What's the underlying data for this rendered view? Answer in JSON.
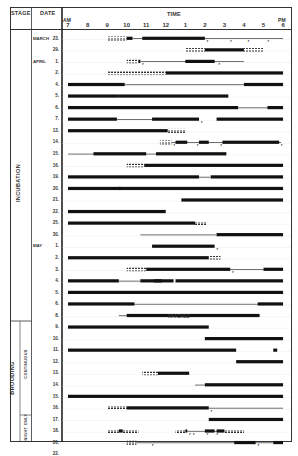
{
  "header": {
    "stage": "STAGE",
    "date": "DATE",
    "time": "TIME",
    "am": "AM",
    "pm": "PM",
    "hours": [
      "7",
      "8",
      "9",
      "10",
      "11",
      "12",
      "1",
      "2",
      "3",
      "4",
      "5",
      "6"
    ]
  },
  "stages": {
    "incubation": "INCUBATION",
    "brooding": "BROODING",
    "continuous": "CONTINUOUS",
    "night_only": "NIGHT ONLY"
  },
  "months": [
    {
      "label": "MARCH",
      "row": 0
    },
    {
      "label": "APRIL",
      "row": 2
    },
    {
      "label": "MAY",
      "row": 18
    }
  ],
  "annotation": {
    "label": "HATCHED",
    "row": 22
  },
  "chart_data": {
    "type": "gantt",
    "title": "",
    "xlabel": "TIME",
    "ylabel": "DATE",
    "x_ticks": [
      "7 AM",
      "8",
      "9",
      "10",
      "11",
      "12",
      "1",
      "2",
      "3",
      "4",
      "5",
      "6 PM"
    ],
    "xlim": [
      7,
      18
    ],
    "legend": {
      "solid_bar": "on nest / attendance",
      "thin_line": "present nearby",
      "dashed": "partial observation",
      "arrow": "departure"
    },
    "rows": [
      {
        "date": "23",
        "month": "MARCH",
        "stage": "incubation",
        "bars": [
          [
            10.0,
            10.3
          ],
          [
            10.8,
            14.0
          ]
        ],
        "thin": [
          [
            10.3,
            18.0
          ]
        ],
        "dashed": [
          [
            9.0,
            10.0
          ]
        ],
        "marks": [
          14.1,
          15.3,
          16.2,
          17.2
        ]
      },
      {
        "date": "29",
        "month": "MARCH",
        "stage": "incubation",
        "bars": [
          [
            14.0,
            16.0
          ]
        ],
        "thin": [],
        "dashed": [
          [
            13.0,
            14.0
          ],
          [
            16.0,
            17.0
          ]
        ],
        "marks": []
      },
      {
        "date": "1",
        "month": "APRIL",
        "stage": "incubation",
        "bars": [
          [
            10.6,
            10.7
          ],
          [
            13.0,
            14.5
          ]
        ],
        "thin": [
          [
            10.7,
            16.0
          ]
        ],
        "dashed": [
          [
            10.0,
            10.6
          ]
        ],
        "marks": [
          10.8,
          14.7
        ]
      },
      {
        "date": "2",
        "month": "APRIL",
        "stage": "incubation",
        "bars": [
          [
            12.0,
            18.0
          ]
        ],
        "thin": [],
        "dashed": [
          [
            9.0,
            12.0
          ]
        ],
        "marks": []
      },
      {
        "date": "4",
        "month": "APRIL",
        "stage": "incubation",
        "bars": [
          [
            7.0,
            9.9
          ],
          [
            16.0,
            18.0
          ]
        ],
        "thin": [
          [
            9.9,
            16.0
          ]
        ],
        "dashed": [],
        "marks": []
      },
      {
        "date": "5",
        "month": "APRIL",
        "stage": "incubation",
        "bars": [
          [
            7.0,
            9.6
          ],
          [
            9.6,
            15.2
          ]
        ],
        "thin": [],
        "dashed": [],
        "marks": []
      },
      {
        "date": "6",
        "month": "APRIL",
        "stage": "incubation",
        "bars": [
          [
            7.0,
            15.7
          ],
          [
            17.2,
            18.0
          ]
        ],
        "thin": [
          [
            15.7,
            17.2
          ]
        ],
        "dashed": [],
        "marks": []
      },
      {
        "date": "7",
        "month": "APRIL",
        "stage": "incubation",
        "bars": [
          [
            7.0,
            9.5
          ],
          [
            11.3,
            13.7
          ],
          [
            14.6,
            18.0
          ]
        ],
        "thin": [
          [
            9.5,
            11.3
          ]
        ],
        "dashed": [],
        "marks": [
          13.8
        ]
      },
      {
        "date": "13",
        "month": "APRIL",
        "stage": "incubation",
        "bars": [
          [
            7.0,
            12.1
          ]
        ],
        "thin": [],
        "dashed": [
          [
            12.1,
            13.0
          ]
        ],
        "marks": []
      },
      {
        "date": "14",
        "month": "APRIL",
        "stage": "incubation",
        "bars": [
          [
            12.5,
            13.1
          ],
          [
            13.7,
            14.2
          ],
          [
            14.9,
            17.8
          ]
        ],
        "thin": [
          [
            12.3,
            17.9
          ]
        ],
        "dashed": [
          [
            11.7,
            12.3
          ]
        ],
        "marks": [
          12.4,
          13.6,
          14.8,
          17.9
        ]
      },
      {
        "date": "15",
        "month": "APRIL",
        "stage": "incubation",
        "bars": [
          [
            8.3,
            11.0
          ],
          [
            11.5,
            15.1
          ]
        ],
        "thin": [
          [
            7.0,
            8.3
          ],
          [
            11.0,
            11.5
          ]
        ],
        "dashed": [],
        "marks": []
      },
      {
        "date": "16",
        "month": "APRIL",
        "stage": "incubation",
        "bars": [
          [
            10.9,
            18.0
          ]
        ],
        "thin": [],
        "dashed": [
          [
            10.0,
            10.9
          ]
        ],
        "marks": []
      },
      {
        "date": "19",
        "month": "APRIL",
        "stage": "incubation",
        "bars": [
          [
            7.0,
            13.7
          ],
          [
            14.3,
            18.0
          ]
        ],
        "thin": [
          [
            13.7,
            14.3
          ]
        ],
        "dashed": [],
        "marks": []
      },
      {
        "date": "20",
        "month": "APRIL",
        "stage": "incubation",
        "bars": [
          [
            7.0,
            9.7
          ],
          [
            9.6,
            18.0
          ]
        ],
        "thin": [],
        "dashed": [],
        "marks": []
      },
      {
        "date": "21",
        "month": "APRIL",
        "stage": "incubation",
        "bars": [
          [
            12.8,
            18.0
          ]
        ],
        "thin": [],
        "dashed": [],
        "marks": []
      },
      {
        "date": "22",
        "month": "APRIL",
        "stage": "incubation",
        "bars": [
          [
            7.0,
            12.0
          ]
        ],
        "thin": [],
        "dashed": [],
        "marks": []
      },
      {
        "date": "25",
        "month": "APRIL",
        "stage": "incubation",
        "bars": [
          [
            7.0,
            13.5
          ]
        ],
        "thin": [],
        "dashed": [
          [
            13.5,
            14.1
          ]
        ],
        "marks": []
      },
      {
        "date": "30",
        "month": "APRIL",
        "stage": "incubation",
        "bars": [
          [
            14.6,
            18.0
          ]
        ],
        "thin": [
          [
            10.7,
            14.6
          ]
        ],
        "dashed": [],
        "marks": []
      },
      {
        "date": "1",
        "month": "MAY",
        "stage": "incubation",
        "bars": [
          [
            11.3,
            14.5
          ]
        ],
        "thin": [],
        "dashed": [],
        "marks": [
          14.6
        ]
      },
      {
        "date": "2",
        "month": "MAY",
        "stage": "incubation",
        "bars": [
          [
            7.0,
            14.2
          ]
        ],
        "thin": [],
        "dashed": [
          [
            14.2,
            14.8
          ]
        ],
        "marks": []
      },
      {
        "date": "3",
        "month": "MAY",
        "stage": "incubation",
        "bars": [
          [
            11.0,
            15.3
          ],
          [
            17.0,
            18.0
          ]
        ],
        "thin": [
          [
            15.3,
            17.0
          ]
        ],
        "dashed": [
          [
            10.0,
            11.0
          ]
        ],
        "marks": [
          15.4
        ]
      },
      {
        "date": "4",
        "month": "MAY",
        "stage": "incubation",
        "bars": [
          [
            7.0,
            9.6
          ],
          [
            10.7,
            12.4
          ],
          [
            12.5,
            18.0
          ],
          [
            11.4,
            11.8
          ]
        ],
        "thin": [
          [
            9.6,
            10.7
          ]
        ],
        "dashed": [],
        "marks": []
      },
      {
        "date": "5",
        "month": "MAY",
        "stage": "brooding-continuous",
        "bars": [
          [
            7.0,
            18.0
          ]
        ],
        "thin": [],
        "dashed": [],
        "marks": []
      },
      {
        "date": "6",
        "month": "MAY",
        "stage": "brooding-continuous",
        "bars": [
          [
            7.0,
            10.4
          ],
          [
            16.7,
            18.0
          ]
        ],
        "thin": [
          [
            10.4,
            16.7
          ]
        ],
        "dashed": [],
        "marks": []
      },
      {
        "date": "8",
        "month": "MAY",
        "stage": "brooding-continuous",
        "bars": [
          [
            10.0,
            16.8
          ]
        ],
        "thin": [
          [
            9.6,
            10.0
          ]
        ],
        "dashed": [],
        "marks": []
      },
      {
        "date": "9",
        "month": "MAY",
        "stage": "brooding-continuous",
        "bars": [
          [
            7.0,
            14.2
          ]
        ],
        "thin": [],
        "dashed": [],
        "marks": []
      },
      {
        "date": "10",
        "month": "MAY",
        "stage": "brooding-continuous",
        "bars": [
          [
            14.0,
            18.0
          ]
        ],
        "thin": [],
        "dashed": [],
        "marks": []
      },
      {
        "date": "11",
        "month": "MAY",
        "stage": "brooding-continuous",
        "bars": [
          [
            7.0,
            15.6
          ],
          [
            17.5,
            17.7
          ]
        ],
        "thin": [],
        "dashed": [],
        "marks": []
      },
      {
        "date": "12",
        "month": "MAY",
        "stage": "brooding-continuous",
        "bars": [
          [
            15.6,
            18.0
          ]
        ],
        "thin": [],
        "dashed": [],
        "marks": []
      },
      {
        "date": "13",
        "month": "MAY",
        "stage": "brooding-continuous",
        "bars": [
          [
            11.6,
            13.2
          ]
        ],
        "thin": [],
        "dashed": [
          [
            10.8,
            11.6
          ]
        ],
        "marks": []
      },
      {
        "date": "14",
        "month": "MAY",
        "stage": "brooding-continuous",
        "bars": [
          [
            14.0,
            18.0
          ]
        ],
        "thin": [
          [
            13.5,
            14.0
          ]
        ],
        "dashed": [],
        "marks": []
      },
      {
        "date": "15",
        "month": "MAY",
        "stage": "brooding-continuous",
        "bars": [
          [
            7.0,
            18.0
          ]
        ],
        "thin": [],
        "dashed": [],
        "marks": []
      },
      {
        "date": "16",
        "month": "MAY",
        "stage": "brooding-continuous",
        "bars": [
          [
            10.0,
            14.2
          ]
        ],
        "thin": [
          [
            14.2,
            18.0
          ]
        ],
        "dashed": [
          [
            9.0,
            10.0
          ]
        ],
        "marks": [
          14.3
        ]
      },
      {
        "date": "17",
        "month": "MAY",
        "stage": "brooding-continuous",
        "bars": [
          [
            14.2,
            18.0
          ]
        ],
        "thin": [],
        "dashed": [],
        "marks": []
      },
      {
        "date": "18",
        "month": "MAY",
        "stage": "brooding-night-only",
        "bars": [
          [
            9.6,
            9.8
          ],
          [
            13.0,
            13.1
          ],
          [
            14.0,
            14.5
          ],
          [
            14.6,
            15.0
          ]
        ],
        "thin": [
          [
            13.1,
            15.0
          ]
        ],
        "dashed": [
          [
            9.0,
            9.6
          ],
          [
            9.8,
            10.6
          ],
          [
            12.5,
            13.0
          ],
          [
            15.0,
            16.0
          ]
        ],
        "marks": [
          13.2,
          13.4,
          14.1,
          14.6
        ]
      },
      {
        "date": "20",
        "month": "MAY",
        "stage": "brooding-night-only",
        "bars": [
          [
            15.5,
            16.6
          ],
          [
            17.5,
            18.0
          ]
        ],
        "thin": [
          [
            10.5,
            15.5
          ],
          [
            16.6,
            17.5
          ]
        ],
        "dashed": [
          [
            10.0,
            10.5
          ]
        ],
        "marks": [
          11.3,
          16.7
        ]
      },
      {
        "date": "22",
        "month": "MAY",
        "stage": "brooding-night-only",
        "bars": [
          [
            7.0,
            11.3
          ],
          [
            15.4,
            17.0
          ]
        ],
        "thin": [
          [
            11.3,
            15.4
          ]
        ],
        "dashed": [
          [
            17.0,
            18.0
          ]
        ],
        "marks": []
      }
    ]
  }
}
